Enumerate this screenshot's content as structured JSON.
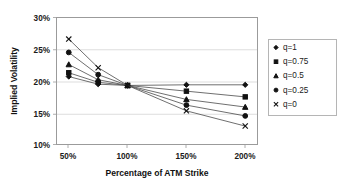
{
  "chart_data": {
    "type": "line",
    "title": "",
    "xlabel": "Percentage of ATM Strike",
    "ylabel": "Implied Volatility",
    "x": [
      50,
      75,
      100,
      150,
      200
    ],
    "x_tick_labels": [
      "50%",
      "100%",
      "150%",
      "200%"
    ],
    "x_tick_values": [
      50,
      100,
      150,
      200
    ],
    "xlim": [
      40,
      210
    ],
    "y_tick_labels": [
      "10%",
      "15%",
      "20%",
      "25%",
      "30%"
    ],
    "y_tick_values": [
      10,
      15,
      20,
      25,
      30
    ],
    "ylim": [
      10,
      30
    ],
    "grid": true,
    "legend_position": "right",
    "series": [
      {
        "name": "q=1",
        "marker": "diamond",
        "values": [
          20.7,
          19.5,
          19.3,
          19.4,
          19.4
        ]
      },
      {
        "name": "q=0.75",
        "marker": "square",
        "values": [
          21.3,
          19.8,
          19.3,
          18.4,
          17.5
        ]
      },
      {
        "name": "q=0.5",
        "marker": "triangle",
        "values": [
          22.6,
          20.2,
          19.3,
          17.1,
          15.9
        ]
      },
      {
        "name": "q=0.25",
        "marker": "circle",
        "values": [
          24.5,
          21.0,
          19.3,
          16.2,
          14.5
        ]
      },
      {
        "name": "q=0",
        "marker": "x",
        "values": [
          26.6,
          22.1,
          19.3,
          15.3,
          12.9
        ]
      }
    ]
  },
  "axes": {
    "y_label": "Implied Volatility",
    "x_label": "Percentage of ATM Strike",
    "y_ticks": [
      "30%",
      "25%",
      "20%",
      "15%",
      "10%"
    ],
    "x_ticks": [
      "50%",
      "100%",
      "150%",
      "200%"
    ]
  },
  "legend": {
    "entries": [
      {
        "label": "q=1",
        "glyph": "diamond-marker-icon"
      },
      {
        "label": "q=0.75",
        "glyph": "square-marker-icon"
      },
      {
        "label": "q=0.5",
        "glyph": "triangle-marker-icon"
      },
      {
        "label": "q=0.25",
        "glyph": "circle-marker-icon"
      },
      {
        "label": "q=0",
        "glyph": "x-marker-icon"
      }
    ]
  },
  "colors": {
    "line": "#4a4a4a",
    "marker": "#111111",
    "frame": "#9b9b9b",
    "grid": "#cfcfcf",
    "background": "#ffffff",
    "text": "#111111"
  }
}
